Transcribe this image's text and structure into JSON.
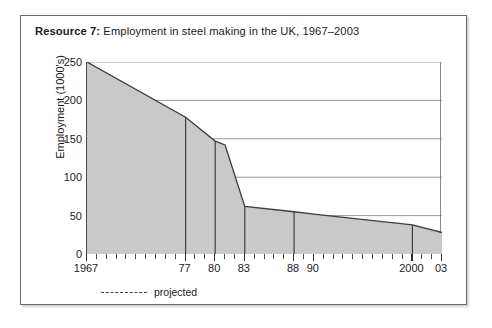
{
  "card": {
    "title_lead": "Resource 7:",
    "title_rest": " Employment in steel making in the UK, 1967–2003"
  },
  "legend": {
    "dash_icon": "dashed-line-icon",
    "label": "projected"
  },
  "chart_data": {
    "type": "area",
    "title": "Resource 7: Employment in steel making in the UK, 1967–2003",
    "xlabel": "",
    "ylabel": "Employment (1000's)",
    "xlim": [
      1967,
      2003
    ],
    "ylim": [
      0,
      250
    ],
    "grid": true,
    "legend_position": "below-plot-left",
    "yticks": [
      0,
      50,
      100,
      150,
      200,
      250
    ],
    "ytick_labels": [
      "0",
      "50",
      "100",
      "150",
      "200",
      "250"
    ],
    "xticks": [
      1967,
      1968,
      1969,
      1970,
      1971,
      1972,
      1973,
      1974,
      1975,
      1976,
      1977,
      1978,
      1979,
      1980,
      1981,
      1982,
      1983,
      1984,
      1985,
      1986,
      1987,
      1988,
      1989,
      1990,
      1991,
      1992,
      1993,
      1994,
      1995,
      1996,
      1997,
      1998,
      1999,
      2000,
      2001,
      2002,
      2003
    ],
    "xtick_labels": [
      {
        "x": 1967,
        "label": "1967"
      },
      {
        "x": 1977,
        "label": "77"
      },
      {
        "x": 1980,
        "label": "80"
      },
      {
        "x": 1983,
        "label": "83"
      },
      {
        "x": 1988,
        "label": "88"
      },
      {
        "x": 1990,
        "label": "90"
      },
      {
        "x": 2000,
        "label": "2000"
      },
      {
        "x": 2003,
        "label": "03"
      }
    ],
    "marker_years": [
      1977,
      1980,
      1983,
      1988,
      2000
    ],
    "x": [
      1967,
      1977,
      1980,
      1981,
      1983,
      1988,
      1990,
      2000,
      2003
    ],
    "values": [
      250,
      178,
      147,
      142,
      62,
      55,
      52,
      38,
      28
    ],
    "series": [
      {
        "name": "Employment in steel making",
        "x": [
          1967,
          1977,
          1980,
          1981,
          1983,
          1988,
          1990,
          2000,
          2003
        ],
        "values": [
          250,
          178,
          147,
          142,
          62,
          55,
          52,
          38,
          28
        ]
      }
    ],
    "fill_color": "#c9c9c9",
    "line_color": "#3d3d3d",
    "grid_color": "#8f8f8f",
    "annotations": [
      "projected"
    ]
  }
}
